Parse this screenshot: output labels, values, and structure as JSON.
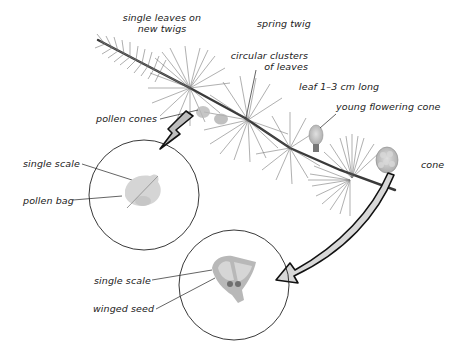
{
  "diagram": {
    "colors": {
      "background": "#ffffff",
      "ink": "#1a1a1a",
      "needles": "#555555",
      "branch": "#3a3a3a",
      "arrow_fill": "#bdbdbd",
      "arrow_stroke": "#111111",
      "cone_fill": "#c4c4c4",
      "scale_fill": "#d0d0d0",
      "circle_stroke": "#222222"
    },
    "labels": {
      "single_leaves_line1": "single leaves on",
      "single_leaves_line2": "new twigs",
      "spring_twig": "spring twig",
      "circular_clusters_line1": "circular clusters",
      "circular_clusters_line2": "of leaves",
      "leaf_length": "leaf 1–3 cm long",
      "young_flowering_cone": "young flowering cone",
      "pollen_cones": "pollen cones",
      "cone": "cone",
      "pollen_single_scale": "single scale",
      "pollen_bag": "pollen bag",
      "seed_single_scale": "single scale",
      "winged_seed": "winged seed"
    },
    "insets": [
      {
        "name": "pollen-cone-detail",
        "contains": [
          "single scale",
          "pollen bag"
        ]
      },
      {
        "name": "seed-cone-detail",
        "contains": [
          "single scale",
          "winged seed"
        ]
      }
    ]
  }
}
